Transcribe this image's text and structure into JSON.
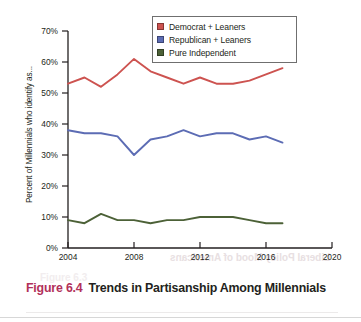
{
  "figure": {
    "number": "Figure 6.4",
    "title": "Trends in Partisanship Among Millennials"
  },
  "ghost_text": {
    "line1": "Liberal Policy Mood of Americans",
    "line2": "Figure 6.3"
  },
  "chart_data": {
    "type": "line",
    "title": "",
    "xlabel": "",
    "ylabel": "Percent of Millennials who identify as...",
    "x": [
      2004,
      2005,
      2006,
      2007,
      2008,
      2009,
      2010,
      2011,
      2012,
      2013,
      2014,
      2015,
      2016,
      2017
    ],
    "xlim": [
      2004,
      2020
    ],
    "ylim": [
      0,
      70
    ],
    "xticks": [
      2004,
      2008,
      2012,
      2016,
      2020
    ],
    "xtick_labels": [
      "2004",
      "2008",
      "2012",
      "2016",
      "2020"
    ],
    "yticks": [
      0,
      10,
      20,
      30,
      40,
      50,
      60,
      70
    ],
    "ytick_labels": [
      "0%",
      "10%",
      "20%",
      "30%",
      "40%",
      "50%",
      "60%",
      "70%"
    ],
    "grid": false,
    "legend_position": "top-center",
    "series": [
      {
        "name": "Democrat + Leaners",
        "color": "#cd5350",
        "values": [
          53,
          55,
          52,
          56,
          61,
          57,
          55,
          53,
          55,
          53,
          53,
          54,
          56,
          58
        ]
      },
      {
        "name": "Republican + Leaners",
        "color": "#5c6cb4",
        "values": [
          38,
          37,
          37,
          36,
          30,
          35,
          36,
          38,
          36,
          37,
          37,
          35,
          36,
          34
        ]
      },
      {
        "name": "Pure Independent",
        "color": "#4c6137",
        "values": [
          9,
          8,
          11,
          9,
          9,
          8,
          9,
          9,
          10,
          10,
          10,
          9,
          8,
          8
        ]
      }
    ]
  }
}
